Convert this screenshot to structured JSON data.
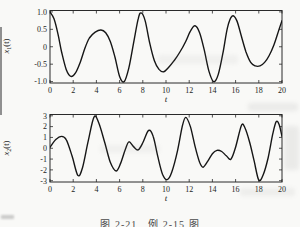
{
  "page": {
    "background": "#f9f9f7"
  },
  "caption": {
    "text": "图 2-21　例 2-15 图"
  },
  "chart_data": [
    {
      "type": "line",
      "title": "",
      "xlabel": "t",
      "ylabel": "x1(t)",
      "ylabel_parts": {
        "base": "x",
        "sub": "1",
        "rest": "(t)"
      },
      "xlim": [
        0,
        20
      ],
      "ylim": [
        -1,
        1
      ],
      "xtick_values": [
        0,
        2,
        4,
        6,
        8,
        10,
        12,
        14,
        16,
        18,
        20
      ],
      "xticks": [
        "0",
        "2",
        "4",
        "6",
        "8",
        "10",
        "12",
        "14",
        "16",
        "18",
        "20"
      ],
      "ytick_values": [
        1.0,
        0.5,
        0,
        -0.5,
        -1.0
      ],
      "yticks": [
        "1.0",
        "0.5",
        "0",
        "-0.5",
        "-1.0"
      ],
      "grid": false,
      "legend": null,
      "line_color": "#161616",
      "box_color": "#2a2a2a",
      "points": [
        [
          0,
          1.0
        ],
        [
          0.35,
          0.8
        ],
        [
          0.7,
          0.35
        ],
        [
          1.0,
          -0.15
        ],
        [
          1.4,
          -0.65
        ],
        [
          1.8,
          -0.85
        ],
        [
          2.2,
          -0.75
        ],
        [
          2.6,
          -0.45
        ],
        [
          3.0,
          -0.05
        ],
        [
          3.4,
          0.25
        ],
        [
          3.9,
          0.42
        ],
        [
          4.4,
          0.48
        ],
        [
          4.8,
          0.4
        ],
        [
          5.2,
          0.15
        ],
        [
          5.6,
          -0.3
        ],
        [
          6.0,
          -0.85
        ],
        [
          6.4,
          -1.0
        ],
        [
          6.8,
          -0.6
        ],
        [
          7.2,
          0.1
        ],
        [
          7.6,
          0.8
        ],
        [
          7.85,
          0.97
        ],
        [
          8.2,
          0.75
        ],
        [
          8.6,
          0.1
        ],
        [
          9.0,
          -0.4
        ],
        [
          9.4,
          -0.65
        ],
        [
          9.8,
          -0.72
        ],
        [
          10.2,
          -0.6
        ],
        [
          10.7,
          -0.4
        ],
        [
          11.2,
          -0.15
        ],
        [
          11.7,
          0.15
        ],
        [
          12.1,
          0.45
        ],
        [
          12.5,
          0.6
        ],
        [
          12.9,
          0.4
        ],
        [
          13.3,
          -0.1
        ],
        [
          13.7,
          -0.7
        ],
        [
          14.1,
          -1.0
        ],
        [
          14.5,
          -0.8
        ],
        [
          14.9,
          -0.2
        ],
        [
          15.3,
          0.55
        ],
        [
          15.7,
          0.88
        ],
        [
          16.1,
          0.75
        ],
        [
          16.5,
          0.3
        ],
        [
          16.9,
          -0.15
        ],
        [
          17.3,
          -0.45
        ],
        [
          17.7,
          -0.55
        ],
        [
          18.1,
          -0.55
        ],
        [
          18.5,
          -0.45
        ],
        [
          18.9,
          -0.25
        ],
        [
          19.3,
          0.05
        ],
        [
          19.7,
          0.45
        ],
        [
          20,
          0.75
        ]
      ]
    },
    {
      "type": "line",
      "title": "",
      "xlabel": "t",
      "ylabel": "x2(t)",
      "ylabel_parts": {
        "base": "x",
        "sub": "2",
        "rest": "(t)"
      },
      "xlim": [
        0,
        20
      ],
      "ylim": [
        -3,
        3
      ],
      "xtick_values": [
        0,
        2,
        4,
        6,
        8,
        10,
        12,
        14,
        16,
        18,
        20
      ],
      "xticks": [
        "0",
        "2",
        "4",
        "6",
        "8",
        "10",
        "12",
        "14",
        "16",
        "18",
        "20"
      ],
      "ytick_values": [
        3,
        2,
        1,
        0,
        -1,
        -2,
        -3
      ],
      "yticks": [
        "3",
        "2",
        "1",
        "0",
        "-1",
        "-2",
        "-3"
      ],
      "grid": false,
      "legend": null,
      "line_color": "#161616",
      "box_color": "#2a2a2a",
      "points": [
        [
          0,
          0.1
        ],
        [
          0.5,
          0.8
        ],
        [
          1.0,
          1.1
        ],
        [
          1.4,
          0.8
        ],
        [
          1.9,
          -0.7
        ],
        [
          2.4,
          -2.5
        ],
        [
          2.8,
          -1.8
        ],
        [
          3.3,
          0.7
        ],
        [
          3.8,
          2.9
        ],
        [
          4.2,
          2.35
        ],
        [
          4.7,
          0.6
        ],
        [
          5.2,
          -1.3
        ],
        [
          5.7,
          -2.1
        ],
        [
          6.1,
          -1.35
        ],
        [
          6.5,
          -0.1
        ],
        [
          6.8,
          0.6
        ],
        [
          7.2,
          0.15
        ],
        [
          7.6,
          -0.15
        ],
        [
          8.0,
          0.5
        ],
        [
          8.5,
          1.65
        ],
        [
          8.9,
          1.1
        ],
        [
          9.3,
          -0.8
        ],
        [
          9.7,
          -2.4
        ],
        [
          10.1,
          -2.9
        ],
        [
          10.5,
          -2.2
        ],
        [
          11.0,
          -0.2
        ],
        [
          11.4,
          2.0
        ],
        [
          11.7,
          2.85
        ],
        [
          12.1,
          2.0
        ],
        [
          12.5,
          0.2
        ],
        [
          12.9,
          -1.3
        ],
        [
          13.2,
          -1.75
        ],
        [
          13.6,
          -1.2
        ],
        [
          14.0,
          -0.5
        ],
        [
          14.4,
          -0.2
        ],
        [
          14.8,
          -0.3
        ],
        [
          15.2,
          -0.7
        ],
        [
          15.6,
          -1.0
        ],
        [
          16.0,
          0.1
        ],
        [
          16.5,
          2.1
        ],
        [
          16.8,
          1.9
        ],
        [
          17.2,
          0.6
        ],
        [
          17.6,
          -1.2
        ],
        [
          18.0,
          -2.95
        ],
        [
          18.4,
          -2.4
        ],
        [
          18.8,
          -0.9
        ],
        [
          19.2,
          1.3
        ],
        [
          19.5,
          2.45
        ],
        [
          19.75,
          2.2
        ],
        [
          20,
          1.1
        ]
      ]
    }
  ]
}
